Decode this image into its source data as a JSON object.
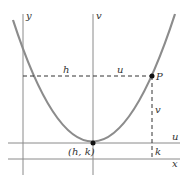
{
  "diagram": {
    "colors": {
      "axis": "#8a8a8a",
      "curve": "#8c8c8c",
      "dashed": "#333333",
      "point": "#111111",
      "text": "#333333"
    },
    "axes": {
      "y_label": "y",
      "v_label": "v",
      "u_label": "u",
      "x_label": "x"
    },
    "labels": {
      "h": "h",
      "u": "u",
      "P": "P",
      "v": "v",
      "k": "k",
      "vertex": "(h, k)"
    },
    "geometry": {
      "vertex": [
        93,
        143
      ],
      "point_P": [
        152,
        76
      ],
      "y_axis_x": 23,
      "v_axis_x": 93,
      "u_axis_y": 143,
      "x_axis_y": 159
    }
  }
}
